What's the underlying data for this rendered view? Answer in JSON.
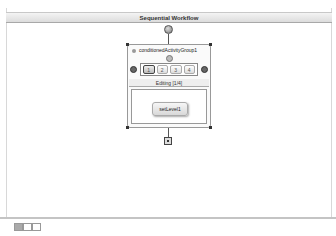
{
  "header": {
    "title": "Sequential Workflow"
  },
  "group": {
    "title": "conditionedActivityGroup1",
    "editing_label": "Editing [1/4]",
    "tabs": [
      "1",
      "2",
      "3",
      "4"
    ],
    "active_tab": 0
  },
  "activity": {
    "label": "setLevel1"
  },
  "bottom_tabs": [
    "workflow",
    "cancel",
    "fault"
  ]
}
